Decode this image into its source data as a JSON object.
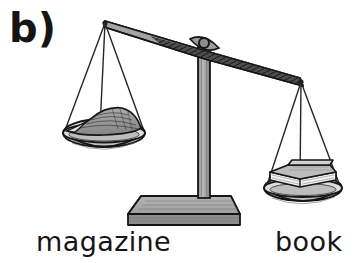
{
  "figure": {
    "panel_letter": "b)",
    "kind": "balance-scale-illustration",
    "background_color": "#ffffff",
    "ink_color": "#151515"
  },
  "labels": {
    "left_item": "magazine",
    "right_item": "book"
  },
  "scale": {
    "beam": {
      "left_tip": [
        105,
        23
      ],
      "right_tip": [
        302,
        82
      ],
      "tilt": "down-right",
      "fill_color": "#9a9a9a",
      "shade_color": "#3a3a3a"
    },
    "pivot": {
      "center": [
        204,
        42
      ],
      "radius": 5,
      "fill_color": "#8e8e8e"
    },
    "column": {
      "left": 198,
      "right": 210,
      "top": 48,
      "bottom": 200,
      "fill_color": "#9c9c9c"
    },
    "base": {
      "top_y": 196,
      "front_y": 215,
      "bottom_y": 226,
      "fill_color": "#a7a7a7",
      "front_color": "#8a8a8a"
    },
    "left_pan": {
      "center": [
        104,
        135
      ],
      "rim_width": 82,
      "rim_height": 14,
      "bowl_depth": 17,
      "fill_color": "#cfcfcf",
      "load": "magazine"
    },
    "right_pan": {
      "center": [
        303,
        190
      ],
      "rim_width": 78,
      "rim_height": 13,
      "bowl_depth": 16,
      "fill_color": "#cfcfcf",
      "load": "book"
    },
    "magazine": {
      "shape": "hatched wedge / stack of pages",
      "fill_color": "#9e9e9e"
    },
    "book": {
      "shape": "flat 3d block",
      "cover_color": "#b4b4b4",
      "page_color": "#f2f2f2"
    },
    "strings": {
      "count_per_pan": 3,
      "color": "#2b2b2b"
    }
  },
  "icons": {
    "balance_scale": "balance-scale-icon"
  }
}
